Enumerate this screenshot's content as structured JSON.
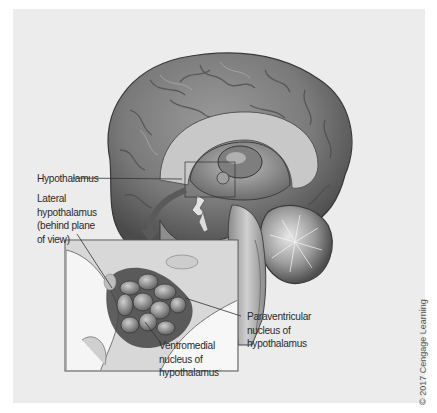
{
  "figure": {
    "background_color": "#ececec",
    "labels": {
      "hypothalamus": "Hypothalamus",
      "lateral": [
        "Lateral",
        "hypothalamus",
        "(behind plane",
        "of view)"
      ],
      "paraventricular": [
        "Paraventricular",
        "nucleus of",
        "hypothalamus"
      ],
      "ventromedial": [
        "Ventromedial",
        "nucleus of",
        "hypothalamus"
      ]
    },
    "credit": "© 2017 Cengage Learning"
  }
}
